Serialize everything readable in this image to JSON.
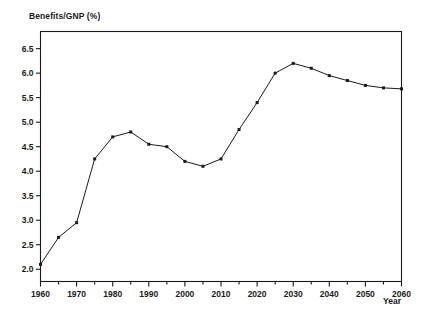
{
  "figure": {
    "y_axis_title": "Benefits/GNP (%)",
    "x_axis_title": "Year"
  },
  "chart_data": {
    "type": "line",
    "title": "",
    "subtitle": "",
    "xlabel": "Year",
    "ylabel": "Benefits/GNP (%)",
    "xlim": [
      1960,
      2060
    ],
    "ylim": [
      1.75,
      6.85
    ],
    "grid": false,
    "legend": null,
    "marker": "square",
    "line_color": "#1a1a1a",
    "marker_color": "#1a1a1a",
    "x_major_ticks": [
      1960,
      1970,
      1980,
      1990,
      2000,
      2010,
      2020,
      2030,
      2040,
      2050,
      2060
    ],
    "x_major_tick_labels": [
      "1960",
      "1970",
      "1980",
      "1990",
      "2000",
      "2010",
      "2020",
      "2030",
      "2040",
      "2050",
      "2060"
    ],
    "x_minor_ticks": [
      1965,
      1975,
      1985,
      1995,
      2005,
      2015,
      2025,
      2035,
      2045,
      2055
    ],
    "y_ticks": [
      2.0,
      2.5,
      3.0,
      3.5,
      4.0,
      4.5,
      5.0,
      5.5,
      6.0,
      6.5
    ],
    "y_tick_labels": [
      "2.0",
      "2.5",
      "3.0",
      "3.5",
      "4.0",
      "4.5",
      "5.0",
      "5.5",
      "6.0",
      "6.5"
    ],
    "x": [
      1960,
      1965,
      1970,
      1975,
      1980,
      1985,
      1990,
      1995,
      2000,
      2005,
      2010,
      2015,
      2020,
      2025,
      2030,
      2035,
      2040,
      2045,
      2050,
      2055,
      2060
    ],
    "values": [
      2.1,
      2.65,
      2.95,
      4.25,
      4.7,
      4.8,
      4.55,
      4.5,
      4.2,
      4.1,
      4.25,
      4.85,
      5.4,
      6.0,
      6.2,
      6.1,
      5.95,
      5.85,
      5.75,
      5.7,
      5.68
    ]
  }
}
